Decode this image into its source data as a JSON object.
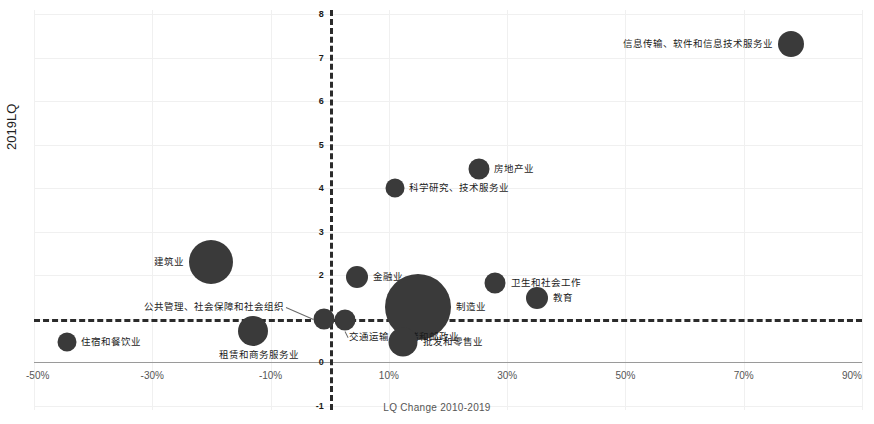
{
  "chart_data": {
    "type": "scatter",
    "title": "",
    "xlabel": "LQ Change 2010-2019",
    "ylabel": "2019LQ",
    "xlim": [
      -50,
      90
    ],
    "ylim": [
      -1,
      8
    ],
    "xticks": [
      "-50%",
      "-30%",
      "-10%",
      "10%",
      "30%",
      "50%",
      "70%",
      "90%"
    ],
    "xtick_values": [
      -50,
      -30,
      -10,
      10,
      30,
      50,
      70,
      90
    ],
    "yticks": [
      "8",
      "7",
      "6",
      "5",
      "4",
      "3",
      "2",
      "1",
      "0",
      "-1"
    ],
    "ytick_values": [
      8,
      7,
      6,
      5,
      4,
      3,
      2,
      1,
      0,
      -1
    ],
    "grid": true,
    "legend": "none",
    "reference_lines": {
      "vertical_x": 0,
      "horizontal_y": 1,
      "style": "dashed",
      "color": "#2b2b2b"
    },
    "bubble_color": "#3a3a3a",
    "points": [
      {
        "label": "信息传输、软件和信息技术服务业",
        "x": 78.0,
        "y": 7.32,
        "size": 26,
        "label_pos": "left"
      },
      {
        "label": "房地产业",
        "x": 25.2,
        "y": 4.45,
        "size": 21,
        "label_pos": "right"
      },
      {
        "label": "科学研究、技术服务业",
        "x": 11.0,
        "y": 4.0,
        "size": 19,
        "label_pos": "right"
      },
      {
        "label": "建筑业",
        "x": -20.0,
        "y": 2.3,
        "size": 44,
        "label_pos": "left"
      },
      {
        "label": "金融业",
        "x": 4.6,
        "y": 1.96,
        "size": 22,
        "label_pos": "right"
      },
      {
        "label": "卫生和社会工作",
        "x": 28.0,
        "y": 1.82,
        "size": 21,
        "label_pos": "right"
      },
      {
        "label": "教育",
        "x": 35.0,
        "y": 1.47,
        "size": 22,
        "label_pos": "right"
      },
      {
        "label": "制造业",
        "x": 15.0,
        "y": 1.28,
        "size": 66,
        "label_pos": "right"
      },
      {
        "label": "公共管理、社会保障和社会组织",
        "x": -1.0,
        "y": 1.0,
        "size": 21,
        "label_pos": "leader-left"
      },
      {
        "label": "交通运输、仓储和邮政业",
        "x": 2.6,
        "y": 0.97,
        "size": 21,
        "label_pos": "leader-below"
      },
      {
        "label": "租赁和商务服务业",
        "x": -13.0,
        "y": 0.73,
        "size": 30,
        "label_pos": "below"
      },
      {
        "label": "批发和零售业",
        "x": 12.4,
        "y": 0.47,
        "size": 29,
        "label_pos": "right"
      },
      {
        "label": "住宿和餐饮业",
        "x": -44.5,
        "y": 0.47,
        "size": 19,
        "label_pos": "right"
      }
    ]
  }
}
